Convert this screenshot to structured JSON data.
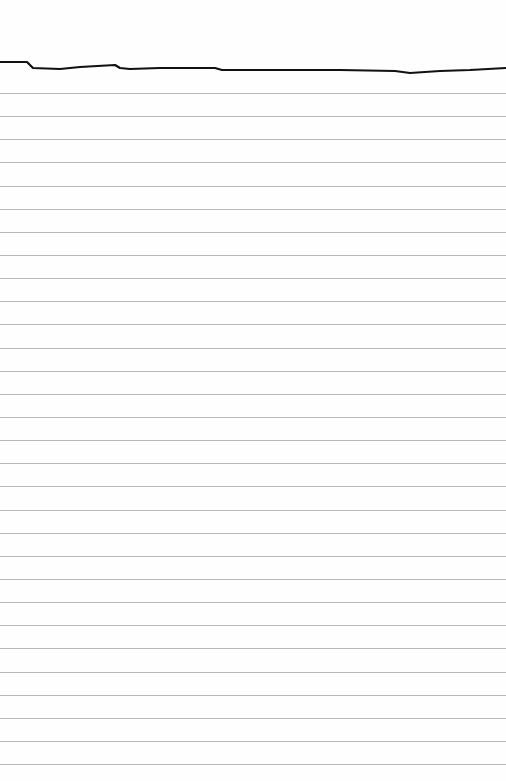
{
  "page": {
    "background": "#fefefe",
    "width": 506,
    "height": 781
  },
  "ruled_lines": {
    "color": "#b9b9b9",
    "first_y": 93,
    "spacing": 23.14,
    "count": 30
  },
  "pen_stroke": {
    "color": "#111111",
    "width": 2.2,
    "points": [
      [
        0,
        62
      ],
      [
        27,
        62
      ],
      [
        33,
        68
      ],
      [
        60,
        69
      ],
      [
        80,
        67
      ],
      [
        115,
        65
      ],
      [
        120,
        68
      ],
      [
        130,
        69
      ],
      [
        160,
        68
      ],
      [
        215,
        68
      ],
      [
        222,
        70
      ],
      [
        245,
        70
      ],
      [
        300,
        70
      ],
      [
        340,
        70
      ],
      [
        395,
        71
      ],
      [
        410,
        73
      ],
      [
        440,
        71
      ],
      [
        470,
        70
      ],
      [
        506,
        68
      ]
    ]
  }
}
